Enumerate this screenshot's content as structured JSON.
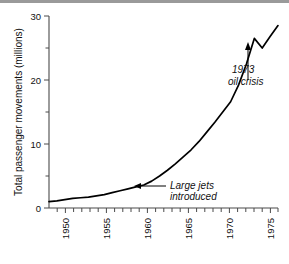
{
  "chart_data": {
    "type": "line",
    "title": "",
    "xlabel": "",
    "ylabel": "Total passenger movements (millions)",
    "xlim": [
      1947,
      1976
    ],
    "ylim": [
      0,
      30
    ],
    "grid": false,
    "legend": "none",
    "x_tick_labels": [
      "1950",
      "1955",
      "1960",
      "1965",
      "1970",
      "1975"
    ],
    "x_tick_values": [
      1950,
      1955,
      1960,
      1965,
      1970,
      1975
    ],
    "x_minor_tick_interval": 1,
    "y_tick_labels": [
      "0",
      "10",
      "20",
      "30"
    ],
    "y_tick_values": [
      0,
      10,
      20,
      30
    ],
    "y_minor_tick_interval": 5,
    "series": [
      {
        "name": "Total passenger movements",
        "x": [
          1947,
          1948,
          1949,
          1950,
          1951,
          1952,
          1953,
          1954,
          1955,
          1956,
          1957,
          1958,
          1959,
          1960,
          1961,
          1962,
          1963,
          1964,
          1965,
          1966,
          1967,
          1968,
          1969,
          1970,
          1971,
          1972,
          1973,
          1974,
          1975,
          1976
        ],
        "y": [
          1.0,
          1.1,
          1.3,
          1.5,
          1.6,
          1.7,
          1.9,
          2.1,
          2.4,
          2.7,
          3.0,
          3.3,
          3.6,
          4.2,
          5.0,
          5.9,
          6.9,
          8.0,
          9.1,
          10.4,
          11.9,
          13.4,
          15.0,
          16.6,
          19.2,
          22.5,
          26.5,
          25.0,
          26.8,
          28.5
        ]
      }
    ],
    "annotations": [
      {
        "id": "large-jets",
        "text_line1": "Large jets",
        "text_line2": "introduced",
        "point_x": 1960.0,
        "point_y": 3.7,
        "style": "italic",
        "arrow": "horizontal-left"
      },
      {
        "id": "oil-crisis",
        "text_line1": "1973",
        "text_line2": "oil crisis",
        "point_x": 1973.5,
        "point_y": 25.6,
        "style": "italic",
        "arrow": "vertical-up"
      }
    ]
  },
  "colors": {
    "line": "#000000",
    "axis": "#4a4a4a",
    "text": "#111111",
    "background": "#ffffff",
    "topbar": "#9a9a9a"
  }
}
